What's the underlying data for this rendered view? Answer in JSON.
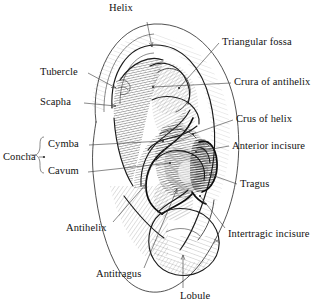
{
  "figure": {
    "view": "lateral view of right auricle",
    "style": "pen-and-ink hatched medical illustration",
    "background_color": "#ffffff",
    "ink_color": "#1a1a1a",
    "signature_mark": "artist monogram"
  },
  "labels": [
    {
      "id": "helix",
      "text": "Helix",
      "side": "top",
      "x": 109,
      "y": 2,
      "anchor_x": 147,
      "anchor_y": 22,
      "tip_x": 152,
      "tip_y": 47,
      "arrow": true
    },
    {
      "id": "tubercle",
      "text": "Tubercle",
      "side": "left",
      "x": 40,
      "y": 66,
      "anchor_x": 88,
      "anchor_y": 73,
      "tip_x": 116,
      "tip_y": 88,
      "arrow": true
    },
    {
      "id": "scapha",
      "text": "Scapha",
      "side": "left",
      "x": 40,
      "y": 96,
      "anchor_x": 84,
      "anchor_y": 103,
      "tip_x": 116,
      "tip_y": 106,
      "arrow": true
    },
    {
      "id": "cymba",
      "text": "Cymba",
      "side": "left",
      "x": 48,
      "y": 138,
      "anchor_x": 89,
      "anchor_y": 145,
      "tip_x": 163,
      "tip_y": 141,
      "arrow": false
    },
    {
      "id": "cavum",
      "text": "Cavum",
      "side": "left",
      "x": 48,
      "y": 165,
      "anchor_x": 88,
      "anchor_y": 172,
      "tip_x": 170,
      "tip_y": 163,
      "arrow": false
    },
    {
      "id": "concha",
      "text": "Concha",
      "side": "left",
      "x": 3,
      "y": 151,
      "anchor_x": 39,
      "anchor_y": 157,
      "tip_x": 44,
      "tip_y": 157,
      "arrow": false
    },
    {
      "id": "antihelix",
      "text": "Antihelix",
      "side": "left",
      "x": 66,
      "y": 222,
      "anchor_x": 113,
      "anchor_y": 222,
      "tip_x": 146,
      "tip_y": 184,
      "arrow": true
    },
    {
      "id": "antitragus",
      "text": "Antitragus",
      "side": "left",
      "x": 96,
      "y": 268,
      "anchor_x": 144,
      "anchor_y": 268,
      "tip_x": 177,
      "tip_y": 189,
      "arrow": true
    },
    {
      "id": "lobule",
      "text": "Lobule",
      "side": "bottom",
      "x": 180,
      "y": 290,
      "anchor_x": 183,
      "anchor_y": 288,
      "tip_x": 183,
      "tip_y": 255,
      "arrow": true
    },
    {
      "id": "triangular-fossa",
      "text": "Triangular fossa",
      "side": "right",
      "x": 222,
      "y": 36,
      "anchor_x": 219,
      "anchor_y": 43,
      "tip_x": 179,
      "tip_y": 88,
      "arrow": false
    },
    {
      "id": "crura-of-antihelix",
      "text": "Crura of antihelix",
      "side": "right",
      "x": 234,
      "y": 76,
      "anchor_x": 231,
      "anchor_y": 83,
      "tip_x": 153,
      "tip_y": 87,
      "arrow": false
    },
    {
      "id": "crus-of-helix",
      "text": "Crus of helix",
      "side": "right",
      "x": 236,
      "y": 113,
      "anchor_x": 233,
      "anchor_y": 120,
      "tip_x": 193,
      "tip_y": 134,
      "arrow": false
    },
    {
      "id": "anterior-incisure",
      "text": "Anterior incisure",
      "side": "right",
      "x": 232,
      "y": 140,
      "anchor_x": 229,
      "anchor_y": 146,
      "tip_x": 196,
      "tip_y": 152,
      "arrow": false
    },
    {
      "id": "tragus",
      "text": "Tragus",
      "side": "right",
      "x": 240,
      "y": 178,
      "anchor_x": 237,
      "anchor_y": 184,
      "tip_x": 209,
      "tip_y": 174,
      "arrow": true
    },
    {
      "id": "intertragic-incisure",
      "text": "Intertragic incisure",
      "side": "right",
      "x": 228,
      "y": 228,
      "anchor_x": 225,
      "anchor_y": 228,
      "tip_x": 200,
      "tip_y": 196,
      "arrow": false
    }
  ],
  "structures": [
    {
      "id": "helix",
      "name": "Helix"
    },
    {
      "id": "tubercle",
      "name": "Tubercle (Darwin's)"
    },
    {
      "id": "scapha",
      "name": "Scapha"
    },
    {
      "id": "triangular-fossa",
      "name": "Triangular fossa"
    },
    {
      "id": "crura-of-antihelix",
      "name": "Crura of antihelix"
    },
    {
      "id": "crus-of-helix",
      "name": "Crus of helix"
    },
    {
      "id": "cymba-conchae",
      "name": "Cymba conchae"
    },
    {
      "id": "cavum-conchae",
      "name": "Cavum conchae"
    },
    {
      "id": "anterior-incisure",
      "name": "Anterior incisure"
    },
    {
      "id": "tragus",
      "name": "Tragus"
    },
    {
      "id": "intertragic-incisure",
      "name": "Intertragic incisure"
    },
    {
      "id": "antihelix",
      "name": "Antihelix"
    },
    {
      "id": "antitragus",
      "name": "Antitragus"
    },
    {
      "id": "lobule",
      "name": "Lobule"
    }
  ]
}
